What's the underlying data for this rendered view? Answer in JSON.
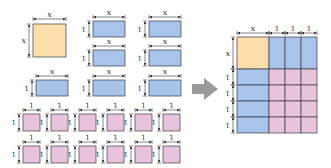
{
  "colors": {
    "x_squared": "#FCDFAA",
    "x_tile": "#A9C4EA",
    "unit_tile": "#E8C3DC",
    "border": "#3b3b4a",
    "arrow": "#9a9a9a",
    "dimension_line": "#333333"
  },
  "labels": {
    "x": "x",
    "one": "1"
  },
  "left_tiles": {
    "x_squared": [
      {
        "x": 33,
        "y": 24,
        "w": 33,
        "h": 33
      }
    ],
    "x_tiles": [
      {
        "x": 93,
        "y": 21,
        "w": 32,
        "h": 16
      },
      {
        "x": 149,
        "y": 21,
        "w": 32,
        "h": 16
      },
      {
        "x": 93,
        "y": 50,
        "w": 32,
        "h": 16
      },
      {
        "x": 149,
        "y": 50,
        "w": 32,
        "h": 16
      },
      {
        "x": 36,
        "y": 80,
        "w": 32,
        "h": 16
      },
      {
        "x": 93,
        "y": 80,
        "w": 32,
        "h": 16
      },
      {
        "x": 149,
        "y": 80,
        "w": 32,
        "h": 16
      }
    ],
    "unit_tiles": [
      {
        "x": 23,
        "y": 114,
        "w": 17,
        "h": 17
      },
      {
        "x": 51,
        "y": 114,
        "w": 17,
        "h": 17
      },
      {
        "x": 79,
        "y": 114,
        "w": 17,
        "h": 17
      },
      {
        "x": 107,
        "y": 114,
        "w": 17,
        "h": 17
      },
      {
        "x": 135,
        "y": 114,
        "w": 17,
        "h": 17
      },
      {
        "x": 163,
        "y": 114,
        "w": 17,
        "h": 17
      },
      {
        "x": 23,
        "y": 146,
        "w": 17,
        "h": 17
      },
      {
        "x": 51,
        "y": 146,
        "w": 17,
        "h": 17
      },
      {
        "x": 79,
        "y": 146,
        "w": 17,
        "h": 17
      },
      {
        "x": 107,
        "y": 146,
        "w": 17,
        "h": 17
      },
      {
        "x": 135,
        "y": 146,
        "w": 17,
        "h": 17
      },
      {
        "x": 163,
        "y": 146,
        "w": 17,
        "h": 17
      }
    ]
  },
  "arrow": {
    "x": 192,
    "y": 78,
    "w": 26,
    "h": 22,
    "direction": "right"
  },
  "right_grid": {
    "x": 237,
    "y": 37,
    "x_size": 32,
    "unit": 16,
    "columns": [
      "x",
      "1",
      "1",
      "1"
    ],
    "rows": [
      "x",
      "1",
      "1",
      "1",
      "1"
    ]
  }
}
